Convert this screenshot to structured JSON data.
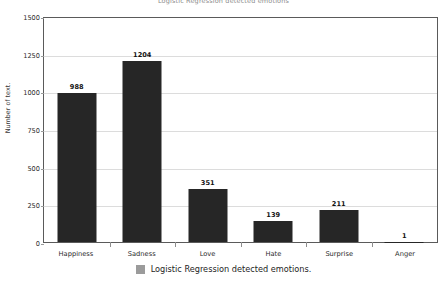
{
  "chart_data": {
    "type": "bar",
    "title": "Logistic Regression detected emotions",
    "xlabel": "",
    "ylabel": "Number of text.",
    "categories": [
      "Happiness",
      "Sadness",
      "Love",
      "Hate",
      "Surprise",
      "Anger"
    ],
    "values": [
      988,
      1204,
      351,
      139,
      211,
      1
    ],
    "value_labels": [
      "988",
      "1204",
      "351",
      "139",
      "211",
      "1"
    ],
    "ylim": [
      0,
      1500
    ],
    "yticks": [
      0,
      250,
      500,
      750,
      1000,
      1250,
      1500
    ],
    "ytick_labels": [
      "0",
      "250",
      "500",
      "750",
      "1000",
      "1250",
      "1500"
    ],
    "grid": true,
    "legend": {
      "position": "bottom",
      "entries": [
        {
          "label": "Logistic Regression detected emotions.",
          "color": "#9b9b9b"
        }
      ]
    },
    "series": [
      {
        "name": "Logistic Regression detected emotions.",
        "color": "#262626",
        "values": [
          988,
          1204,
          351,
          139,
          211,
          1
        ]
      }
    ],
    "colors": {
      "bar": "#262626",
      "grid": "#dcdcdc",
      "axis": "#5a5a5a",
      "background": "#ffffff",
      "text": "#2b2b2b"
    }
  }
}
